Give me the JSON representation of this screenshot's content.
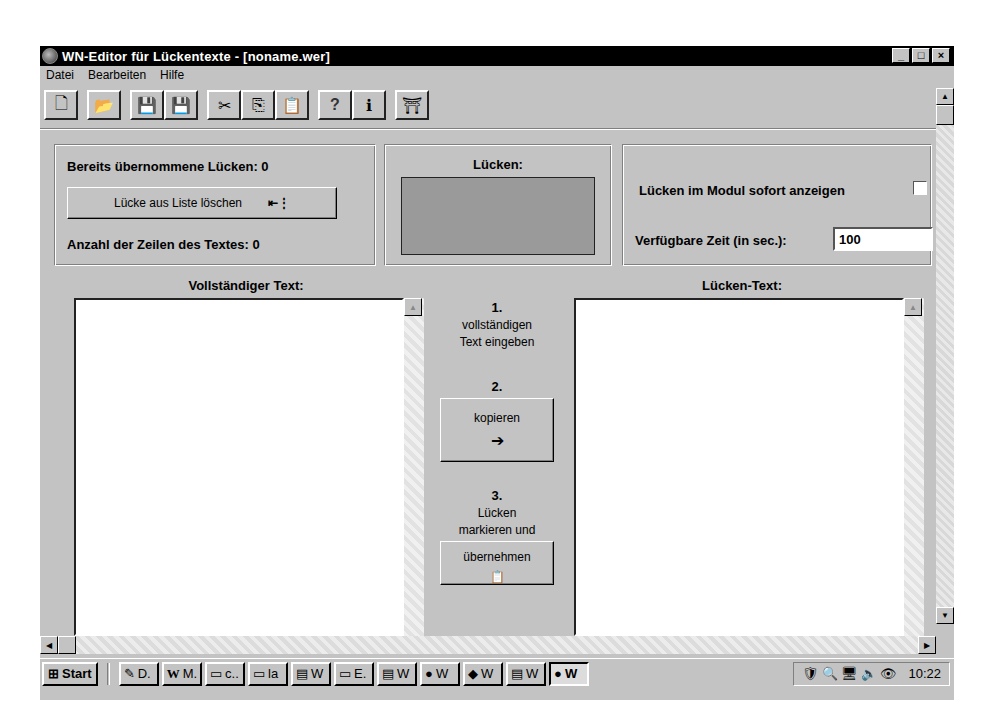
{
  "window": {
    "title": "WN-Editor für Lückentexte - [noname.wer]",
    "controls": {
      "minimize": "_",
      "maximize": "□",
      "close": "×"
    }
  },
  "menu": [
    {
      "label": "Datei"
    },
    {
      "label": "Bearbeiten"
    },
    {
      "label": "Hilfe"
    }
  ],
  "toolbar": {
    "groups": [
      [
        {
          "name": "new-file",
          "glyph": "🗋"
        }
      ],
      [
        {
          "name": "open-folder",
          "glyph": "📂"
        }
      ],
      [
        {
          "name": "save",
          "glyph": "💾"
        },
        {
          "name": "save-as",
          "glyph": "💾"
        }
      ],
      [
        {
          "name": "cut",
          "glyph": "✂"
        },
        {
          "name": "copy",
          "glyph": "⎘"
        },
        {
          "name": "paste",
          "glyph": "📋"
        }
      ],
      [
        {
          "name": "help",
          "glyph": "?"
        },
        {
          "name": "info",
          "glyph": "ℹ"
        }
      ],
      [
        {
          "name": "exit",
          "glyph": "⛩"
        }
      ]
    ]
  },
  "panel_left": {
    "accepted_gaps_label": "Bereits übernommene Lücken: 0",
    "delete_button": "Lücke aus Liste löschen",
    "line_count_label": "Anzahl der Zeilen des Textes: 0"
  },
  "panel_gaps": {
    "caption": "Lücken:"
  },
  "panel_options": {
    "show_gaps_label": "Lücken im Modul sofort anzeigen",
    "show_gaps_checked": false,
    "time_label": "Verfügbare Zeit (in sec.):",
    "time_value": "100"
  },
  "full_text": {
    "caption": "Vollständiger Text:",
    "value": ""
  },
  "gap_text": {
    "caption": "Lücken-Text:",
    "value": ""
  },
  "steps": {
    "step1_num": "1.",
    "step1_line1": "vollständigen",
    "step1_line2": "Text eingeben",
    "step2_num": "2.",
    "step2_button": "kopieren",
    "step3_num": "3.",
    "step3_line1": "Lücken",
    "step3_line2": "markieren und",
    "step3_button": "übernehmen"
  },
  "taskbar": {
    "start": "Start",
    "tasks": [
      {
        "label": "D.",
        "icon": "✎"
      },
      {
        "label": "M.",
        "icon": "W"
      },
      {
        "label": "c..",
        "icon": "▭"
      },
      {
        "label": "la",
        "icon": "▭"
      },
      {
        "label": "W",
        "icon": "▤"
      },
      {
        "label": "E.",
        "icon": "▭"
      },
      {
        "label": "W",
        "icon": "▤"
      },
      {
        "label": "W",
        "icon": "●"
      },
      {
        "label": "W",
        "icon": "◆"
      },
      {
        "label": "W",
        "icon": "▤"
      },
      {
        "label": "W",
        "icon": "●",
        "active": true
      }
    ],
    "tray_icons": [
      "🛡",
      "🔍",
      "🖥",
      "🔈",
      "👁"
    ],
    "clock": "10:22"
  }
}
